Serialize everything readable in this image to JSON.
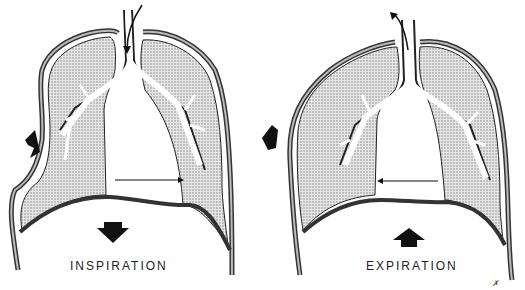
{
  "panels": [
    {
      "id": "inspiration",
      "label": "INSPIRATION",
      "diaphragm_arrow": "down",
      "chest_arrow": "outward",
      "mediastinum_arrow": "right",
      "airflow": "in"
    },
    {
      "id": "expiration",
      "label": "EXPIRATION",
      "diaphragm_arrow": "up",
      "chest_arrow": "outward-up",
      "mediastinum_arrow": "left",
      "airflow": "out"
    }
  ],
  "signature": "artist-initials",
  "colors": {
    "ink": "#111111",
    "lung_fill": "#c9c9c9",
    "background": "#ffffff"
  }
}
